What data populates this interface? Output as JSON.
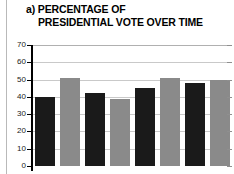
{
  "figure": {
    "panel_label": "a)",
    "title_line_1": "a) PERCENTAGE OF",
    "title_line_2": "PRESIDENTIAL VOTE OVER TIME"
  },
  "colors": {
    "bar_dark": "#1a1a1a",
    "bar_gray": "#8a8a8a",
    "gridline": "#c9c9c9",
    "axis": "#000000",
    "rule": "#b9b9b9",
    "background": "#ffffff"
  },
  "chart_data": {
    "type": "bar",
    "title": "a) PERCENTAGE OF PRESIDENTIAL VOTE OVER TIME",
    "xlabel": "",
    "ylabel": "",
    "ylim": [
      0,
      70
    ],
    "yticks": [
      0,
      10,
      20,
      30,
      40,
      50,
      60,
      70
    ],
    "ytick_labels": [
      "0",
      "10",
      "20",
      "30",
      "40",
      "50",
      "60",
      "70"
    ],
    "grid": true,
    "legend": "none",
    "categories": [
      "1",
      "2",
      "3",
      "4",
      "5",
      "6",
      "7",
      "8"
    ],
    "values": [
      40,
      51,
      42,
      39,
      45,
      51,
      48,
      50
    ],
    "bar_colors": [
      "#1a1a1a",
      "#8a8a8a",
      "#1a1a1a",
      "#8a8a8a",
      "#1a1a1a",
      "#8a8a8a",
      "#1a1a1a",
      "#8a8a8a"
    ],
    "note": "x-axis tick labels are cropped out of the visible image"
  }
}
